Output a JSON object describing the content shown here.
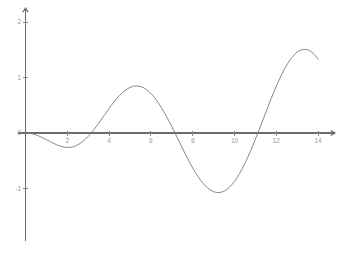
{
  "chart_data": {
    "type": "line",
    "title": "",
    "subtitle": "",
    "xlabel": "",
    "ylabel": "",
    "xlim": [
      -0.35,
      14.8
    ],
    "ylim": [
      -1.95,
      2.25
    ],
    "grid": false,
    "legend": null,
    "x_ticks": [
      {
        "value": 2,
        "label": "2"
      },
      {
        "value": 4,
        "label": "4"
      },
      {
        "value": 6,
        "label": "6"
      },
      {
        "value": 8,
        "label": "8"
      },
      {
        "value": 10,
        "label": "10"
      },
      {
        "value": 12,
        "label": "12"
      },
      {
        "value": 14,
        "label": "14"
      }
    ],
    "y_ticks": [
      {
        "value": 2,
        "label": "2"
      },
      {
        "value": 1,
        "label": "1"
      },
      {
        "value": 0,
        "label": "0"
      },
      {
        "value": -1,
        "label": "-1"
      }
    ],
    "origin_label": "0",
    "series": [
      {
        "name": "f(x)",
        "color": "#7a7a7a",
        "x": [
          0.0,
          0.25,
          0.5,
          0.75,
          1.0,
          1.25,
          1.5,
          1.75,
          2.0,
          2.25,
          2.5,
          2.75,
          3.0,
          3.25,
          3.5,
          3.75,
          4.0,
          4.25,
          4.5,
          4.75,
          5.0,
          5.25,
          5.5,
          5.75,
          6.0,
          6.25,
          6.5,
          6.75,
          7.0,
          7.25,
          7.5,
          7.75,
          8.0,
          8.25,
          8.5,
          8.75,
          9.0,
          9.25,
          9.5,
          9.75,
          10.0,
          10.25,
          10.5,
          10.75,
          11.0,
          11.25,
          11.5,
          11.75,
          12.0,
          12.25,
          12.5,
          12.75,
          13.0,
          13.25,
          13.5,
          13.75,
          14.0
        ],
        "y": [
          0.0,
          -0.009,
          -0.034,
          -0.073,
          -0.12,
          -0.17,
          -0.214,
          -0.246,
          -0.26,
          -0.253,
          -0.214,
          -0.15,
          -0.06,
          0.05,
          0.176,
          0.31,
          0.443,
          0.568,
          0.677,
          0.763,
          0.821,
          0.847,
          0.838,
          0.793,
          0.713,
          0.601,
          0.46,
          0.296,
          0.115,
          -0.075,
          -0.268,
          -0.455,
          -0.629,
          -0.782,
          -0.908,
          -1.001,
          -1.057,
          -1.073,
          -1.048,
          -0.98,
          -0.872,
          -0.726,
          -0.546,
          -0.339,
          -0.111,
          0.129,
          0.374,
          0.615,
          0.843,
          1.049,
          1.225,
          1.363,
          1.458,
          1.504,
          1.499,
          1.441,
          1.331
        ],
        "key_points": [
          {
            "x": 0.0,
            "y": 0.0,
            "type": "origin"
          },
          {
            "x": 2.3,
            "y": -0.33,
            "type": "local-minimum"
          },
          {
            "x": 3.45,
            "y": 0.0,
            "type": "zero-crossing"
          },
          {
            "x": 5.4,
            "y": 1.18,
            "type": "local-maximum"
          },
          {
            "x": 7.0,
            "y": 0.0,
            "type": "zero-crossing"
          },
          {
            "x": 8.3,
            "y": -1.55,
            "type": "local-minimum"
          },
          {
            "x": 10.1,
            "y": 0.0,
            "type": "zero-crossing"
          },
          {
            "x": 11.3,
            "y": 2.0,
            "type": "global-maximum"
          },
          {
            "x": 13.5,
            "y": 0.0,
            "type": "zero-crossing"
          },
          {
            "x": 14.0,
            "y": -1.45,
            "type": "endpoint"
          }
        ]
      }
    ]
  }
}
